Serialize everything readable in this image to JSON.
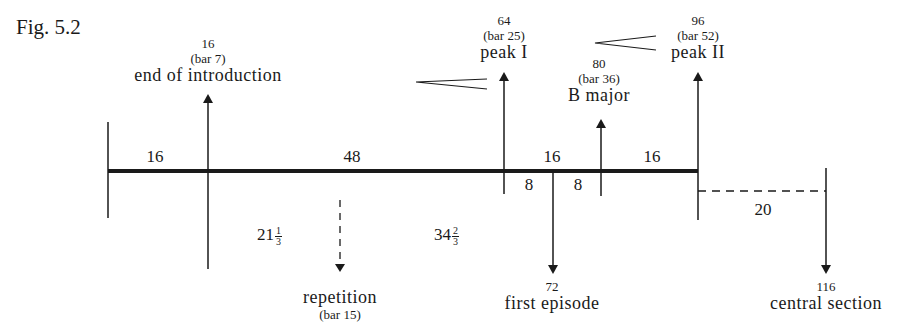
{
  "figure": {
    "title": "Fig. 5.2"
  },
  "timeline": {
    "segments": [
      {
        "label": "16",
        "from": 0,
        "to": 16
      },
      {
        "label": "48",
        "from": 16,
        "to": 64
      },
      {
        "label": "16",
        "from": 64,
        "to": 80
      },
      {
        "label": "16",
        "from": 80,
        "to": 96
      }
    ],
    "subsegments": [
      {
        "label": "8",
        "from": 64,
        "to": 72
      },
      {
        "label": "8",
        "from": 72,
        "to": 80
      }
    ],
    "dashed_segment": {
      "label": "20",
      "from": 96,
      "to": 116
    },
    "proportions": [
      {
        "whole": "21",
        "num": "1",
        "den": "3"
      },
      {
        "whole": "34",
        "num": "2",
        "den": "3"
      }
    ]
  },
  "markers_up": [
    {
      "value": "16",
      "bar": "(bar 7)",
      "name": "end of introduction"
    },
    {
      "value": "64",
      "bar": "(bar 25)",
      "name": "peak I"
    },
    {
      "value": "80",
      "bar": "(bar 36)",
      "name": "B major"
    },
    {
      "value": "96",
      "bar": "(bar 52)",
      "name": "peak II"
    }
  ],
  "markers_down": [
    {
      "value": "",
      "bar": "(bar 15)",
      "name": "repetition",
      "style": "dashed"
    },
    {
      "value": "72",
      "bar": "",
      "name": "first episode",
      "style": "solid"
    },
    {
      "value": "116",
      "bar": "",
      "name": "central section",
      "style": "solid"
    }
  ],
  "hairpins": [
    {
      "type": "crescendo",
      "near": "peak I"
    },
    {
      "type": "crescendo",
      "near": "peak II"
    }
  ]
}
